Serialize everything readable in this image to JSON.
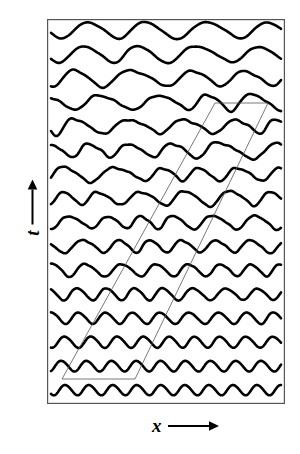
{
  "figure": {
    "type": "spatiotemporal-wave-trace-diagram",
    "title": "",
    "background_color": "#ffffff",
    "frame_color": "#555555",
    "trace_color": "#000000",
    "guide_line_color": "#555555"
  },
  "axes": {
    "x": {
      "letter": "x",
      "arrow": "right-arrow",
      "label_full": "x ⟶",
      "description": "space"
    },
    "y": {
      "letter": "t",
      "arrow": "up-arrow",
      "label_full": "t ⟶",
      "description": "time, increasing upward"
    }
  },
  "chart_data": {
    "type": "line",
    "title": "",
    "xlabel": "x",
    "ylabel": "t",
    "grid": false,
    "legend": false,
    "axis_ticks": false,
    "frame": "box",
    "n_traces": 16,
    "trace_spacing_px": 24,
    "xlim": [
      0,
      1
    ],
    "series": [
      {
        "name": "trace-01",
        "time_index": 0,
        "wavelength_periods": 9.6,
        "amplitude": 0.42,
        "irregularity": 0.02
      },
      {
        "name": "trace-02",
        "time_index": 1,
        "wavelength_periods": 9.2,
        "amplitude": 0.44,
        "irregularity": 0.05
      },
      {
        "name": "trace-03",
        "time_index": 2,
        "wavelength_periods": 8.8,
        "amplitude": 0.46,
        "irregularity": 0.1
      },
      {
        "name": "trace-04",
        "time_index": 3,
        "wavelength_periods": 8.3,
        "amplitude": 0.48,
        "irregularity": 0.16
      },
      {
        "name": "trace-05",
        "time_index": 4,
        "wavelength_periods": 7.7,
        "amplitude": 0.5,
        "irregularity": 0.23
      },
      {
        "name": "trace-06",
        "time_index": 5,
        "wavelength_periods": 7.1,
        "amplitude": 0.53,
        "irregularity": 0.31
      },
      {
        "name": "trace-07",
        "time_index": 6,
        "wavelength_periods": 6.6,
        "amplitude": 0.55,
        "irregularity": 0.39
      },
      {
        "name": "trace-08",
        "time_index": 7,
        "wavelength_periods": 6.1,
        "amplitude": 0.57,
        "irregularity": 0.47
      },
      {
        "name": "trace-09",
        "time_index": 8,
        "wavelength_periods": 5.7,
        "amplitude": 0.59,
        "irregularity": 0.54
      },
      {
        "name": "trace-10",
        "time_index": 9,
        "wavelength_periods": 5.3,
        "amplitude": 0.61,
        "irregularity": 0.6
      },
      {
        "name": "trace-11",
        "time_index": 10,
        "wavelength_periods": 5.0,
        "amplitude": 0.63,
        "irregularity": 0.64
      },
      {
        "name": "trace-12",
        "time_index": 11,
        "wavelength_periods": 4.7,
        "amplitude": 0.65,
        "irregularity": 0.62
      },
      {
        "name": "trace-13",
        "time_index": 12,
        "wavelength_periods": 4.4,
        "amplitude": 0.66,
        "irregularity": 0.55
      },
      {
        "name": "trace-14",
        "time_index": 13,
        "wavelength_periods": 4.2,
        "amplitude": 0.67,
        "irregularity": 0.44
      },
      {
        "name": "trace-15",
        "time_index": 14,
        "wavelength_periods": 4.0,
        "amplitude": 0.68,
        "irregularity": 0.32
      },
      {
        "name": "trace-16",
        "time_index": 15,
        "wavelength_periods": 3.9,
        "amplitude": 0.68,
        "irregularity": 0.22
      }
    ],
    "annotations": [
      {
        "name": "modulation-front-parallelogram",
        "shape": "parallelogram",
        "stroke_width": 0.8,
        "vertices_px": [
          {
            "x": 62,
            "y": 379
          },
          {
            "x": 135,
            "y": 379
          },
          {
            "x": 268,
            "y": 103
          },
          {
            "x": 215,
            "y": 103
          }
        ],
        "description": "thin guide lines tracking the drift of the wave-modulation front in space-time"
      }
    ]
  }
}
